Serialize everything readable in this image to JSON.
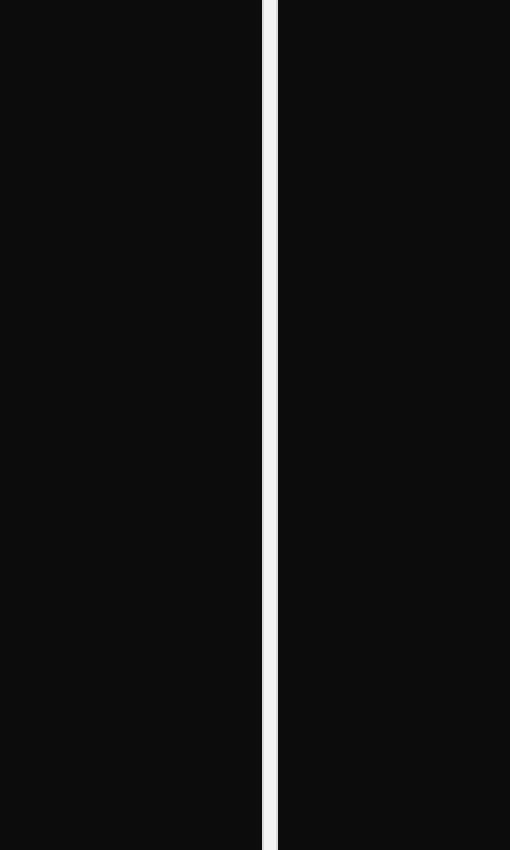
{
  "screen": {
    "background_color": "#0b0b0b",
    "panes": [
      {
        "id": "left",
        "content": ""
      },
      {
        "id": "right",
        "content": ""
      }
    ],
    "divider": {
      "orientation": "vertical",
      "color": "#f3f3f3"
    }
  }
}
